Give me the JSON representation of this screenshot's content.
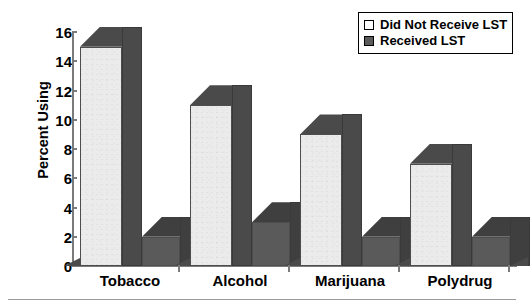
{
  "chart_data": {
    "type": "bar",
    "title": "",
    "xlabel": "",
    "ylabel": "Percent Using",
    "ylim": [
      0,
      16
    ],
    "yticks": [
      0,
      2,
      4,
      6,
      8,
      10,
      12,
      14,
      16
    ],
    "grid": false,
    "legend_position": "top-right",
    "categories": [
      "Tobacco",
      "Alcohol",
      "Marijuana",
      "Polydrug"
    ],
    "series": [
      {
        "name": "Did Not Receive LST",
        "values": [
          15,
          11,
          9,
          7
        ],
        "color": "#ebebeb"
      },
      {
        "name": "Received LST",
        "values": [
          2,
          3,
          2,
          2
        ],
        "color": "#5a5a5a"
      }
    ]
  },
  "axis": {
    "y_title": "Percent Using",
    "y_tick_labels": [
      "0",
      "2",
      "4",
      "6",
      "8",
      "10",
      "12",
      "14",
      "16"
    ],
    "x_tick_labels": [
      "Tobacco",
      "Alcohol",
      "Marijuana",
      "Polydrug"
    ]
  },
  "legend": {
    "items": [
      {
        "label": "Did Not Receive LST",
        "swatch": "light-swatch"
      },
      {
        "label": "Received LST",
        "swatch": "dark-swatch"
      }
    ]
  },
  "colors": {
    "light_bar": "#ebebeb",
    "dark_bar": "#5a5a5a",
    "axis": "#7b7b7b",
    "text": "#000000"
  }
}
